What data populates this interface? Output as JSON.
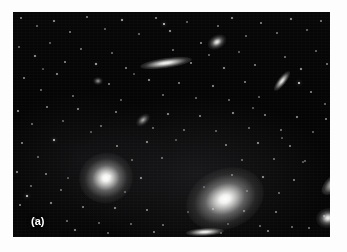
{
  "figure": {
    "panel_label": "(a)",
    "caption_alt": "",
    "background_color": "#ffffff",
    "plate_color": "#050505",
    "plate": {
      "x": 13,
      "y": 12,
      "width": 317,
      "height": 225
    }
  },
  "chart_data": {
    "type": "scatter",
    "title": "",
    "subtitle": "",
    "xlabel": "",
    "ylabel": "",
    "grid": false,
    "legend_position": "none",
    "annotations": [
      "(a)"
    ],
    "xlim": [
      0,
      317
    ],
    "ylim": [
      0,
      225
    ],
    "galaxies": [
      {
        "name": "large-elliptical-left",
        "x": 66,
        "y": 141,
        "rx": 27,
        "ry": 25,
        "rot": -15,
        "class": "gx-ell",
        "brightness": 1.0
      },
      {
        "name": "large-elliptical-center",
        "x": 172,
        "y": 157,
        "rx": 40,
        "ry": 30,
        "rot": -22,
        "class": "gx-ell",
        "brightness": 1.0
      },
      {
        "name": "edge-on-spiral-top",
        "x": 127,
        "y": 46,
        "rx": 26,
        "ry": 5,
        "rot": -8,
        "class": "gx-edge",
        "brightness": 0.95
      },
      {
        "name": "edge-on-lenticular-bottom",
        "x": 173,
        "y": 216,
        "rx": 19,
        "ry": 4,
        "rot": -3,
        "class": "gx-edge",
        "brightness": 0.95
      },
      {
        "name": "small-elliptical-top-right",
        "x": 194,
        "y": 23,
        "rx": 10,
        "ry": 7,
        "rot": -30,
        "class": "gx-ell",
        "brightness": 0.9
      },
      {
        "name": "inclined-spiral-right",
        "x": 257,
        "y": 65,
        "rx": 12,
        "ry": 4,
        "rot": -52,
        "class": "gx-edge",
        "brightness": 0.88
      },
      {
        "name": "small-spiral-mid-left",
        "x": 122,
        "y": 103,
        "rx": 8,
        "ry": 5,
        "rot": -40,
        "class": "gx-faint",
        "brightness": 0.8
      },
      {
        "name": "elongated-galaxy-right-edge",
        "x": 306,
        "y": 163,
        "rx": 16,
        "ry": 8,
        "rot": -40,
        "class": "gx-edge",
        "brightness": 0.92
      },
      {
        "name": "round-galaxy-right-edge",
        "x": 303,
        "y": 196,
        "rx": 12,
        "ry": 10,
        "rot": -10,
        "class": "gx-ell",
        "brightness": 0.92
      },
      {
        "name": "faint-fuzzy-upper-left",
        "x": 80,
        "y": 65,
        "rx": 5,
        "ry": 4,
        "rot": 0,
        "class": "gx-faint",
        "brightness": 0.7
      }
    ],
    "stars": [
      {
        "x": 8,
        "y": 6,
        "r": 0.8,
        "b": 0.5
      },
      {
        "x": 24,
        "y": 14,
        "r": 0.7,
        "b": 0.4
      },
      {
        "x": 41,
        "y": 9,
        "r": 0.9,
        "b": 0.6
      },
      {
        "x": 57,
        "y": 20,
        "r": 0.7,
        "b": 0.45
      },
      {
        "x": 74,
        "y": 5,
        "r": 0.8,
        "b": 0.5
      },
      {
        "x": 92,
        "y": 17,
        "r": 0.7,
        "b": 0.38
      },
      {
        "x": 109,
        "y": 8,
        "r": 1.0,
        "b": 0.7
      },
      {
        "x": 126,
        "y": 22,
        "r": 0.7,
        "b": 0.42
      },
      {
        "x": 143,
        "y": 6,
        "r": 0.8,
        "b": 0.52
      },
      {
        "x": 157,
        "y": 19,
        "r": 0.9,
        "b": 0.62
      },
      {
        "x": 151,
        "y": 12,
        "r": 1.3,
        "b": 0.85
      },
      {
        "x": 174,
        "y": 10,
        "r": 0.7,
        "b": 0.4
      },
      {
        "x": 188,
        "y": 31,
        "r": 0.8,
        "b": 0.55
      },
      {
        "x": 205,
        "y": 14,
        "r": 0.7,
        "b": 0.44
      },
      {
        "x": 219,
        "y": 6,
        "r": 0.9,
        "b": 0.58
      },
      {
        "x": 233,
        "y": 24,
        "r": 0.7,
        "b": 0.4
      },
      {
        "x": 248,
        "y": 11,
        "r": 0.8,
        "b": 0.5
      },
      {
        "x": 264,
        "y": 21,
        "r": 0.7,
        "b": 0.43
      },
      {
        "x": 278,
        "y": 7,
        "r": 0.9,
        "b": 0.6
      },
      {
        "x": 294,
        "y": 18,
        "r": 0.7,
        "b": 0.4
      },
      {
        "x": 308,
        "y": 9,
        "r": 0.8,
        "b": 0.48
      },
      {
        "x": 6,
        "y": 35,
        "r": 0.7,
        "b": 0.42
      },
      {
        "x": 22,
        "y": 44,
        "r": 0.9,
        "b": 0.62
      },
      {
        "x": 37,
        "y": 31,
        "r": 0.7,
        "b": 0.38
      },
      {
        "x": 52,
        "y": 50,
        "r": 0.8,
        "b": 0.52
      },
      {
        "x": 68,
        "y": 37,
        "r": 0.7,
        "b": 0.44
      },
      {
        "x": 83,
        "y": 52,
        "r": 1.0,
        "b": 0.72
      },
      {
        "x": 99,
        "y": 41,
        "r": 0.7,
        "b": 0.4
      },
      {
        "x": 113,
        "y": 56,
        "r": 0.8,
        "b": 0.5
      },
      {
        "x": 160,
        "y": 38,
        "r": 0.7,
        "b": 0.42
      },
      {
        "x": 178,
        "y": 51,
        "r": 0.8,
        "b": 0.54
      },
      {
        "x": 196,
        "y": 43,
        "r": 0.7,
        "b": 0.4
      },
      {
        "x": 211,
        "y": 56,
        "r": 0.9,
        "b": 0.6
      },
      {
        "x": 226,
        "y": 40,
        "r": 0.7,
        "b": 0.38
      },
      {
        "x": 242,
        "y": 53,
        "r": 0.8,
        "b": 0.5
      },
      {
        "x": 272,
        "y": 45,
        "r": 0.7,
        "b": 0.43
      },
      {
        "x": 288,
        "y": 57,
        "r": 0.9,
        "b": 0.62
      },
      {
        "x": 303,
        "y": 39,
        "r": 0.7,
        "b": 0.4
      },
      {
        "x": 314,
        "y": 52,
        "r": 0.8,
        "b": 0.48
      },
      {
        "x": 286,
        "y": 71,
        "r": 1.4,
        "b": 0.9
      },
      {
        "x": 11,
        "y": 66,
        "r": 0.8,
        "b": 0.52
      },
      {
        "x": 28,
        "y": 78,
        "r": 0.7,
        "b": 0.4
      },
      {
        "x": 44,
        "y": 62,
        "r": 0.9,
        "b": 0.58
      },
      {
        "x": 60,
        "y": 84,
        "r": 0.7,
        "b": 0.42
      },
      {
        "x": 96,
        "y": 72,
        "r": 0.8,
        "b": 0.5
      },
      {
        "x": 108,
        "y": 88,
        "r": 0.7,
        "b": 0.38
      },
      {
        "x": 136,
        "y": 68,
        "r": 0.9,
        "b": 0.6
      },
      {
        "x": 150,
        "y": 83,
        "r": 0.7,
        "b": 0.42
      },
      {
        "x": 166,
        "y": 71,
        "r": 0.8,
        "b": 0.5
      },
      {
        "x": 183,
        "y": 86,
        "r": 0.7,
        "b": 0.4
      },
      {
        "x": 200,
        "y": 74,
        "r": 0.9,
        "b": 0.58
      },
      {
        "x": 216,
        "y": 88,
        "r": 0.7,
        "b": 0.41
      },
      {
        "x": 232,
        "y": 70,
        "r": 0.8,
        "b": 0.5
      },
      {
        "x": 246,
        "y": 85,
        "r": 0.7,
        "b": 0.38
      },
      {
        "x": 298,
        "y": 80,
        "r": 0.8,
        "b": 0.52
      },
      {
        "x": 312,
        "y": 92,
        "r": 0.7,
        "b": 0.4
      },
      {
        "x": 5,
        "y": 99,
        "r": 0.9,
        "b": 0.6
      },
      {
        "x": 19,
        "y": 112,
        "r": 0.7,
        "b": 0.42
      },
      {
        "x": 34,
        "y": 95,
        "r": 0.8,
        "b": 0.5
      },
      {
        "x": 50,
        "y": 109,
        "r": 0.7,
        "b": 0.38
      },
      {
        "x": 65,
        "y": 97,
        "r": 0.9,
        "b": 0.56
      },
      {
        "x": 88,
        "y": 114,
        "r": 0.7,
        "b": 0.41
      },
      {
        "x": 103,
        "y": 100,
        "r": 0.8,
        "b": 0.5
      },
      {
        "x": 140,
        "y": 116,
        "r": 0.7,
        "b": 0.4
      },
      {
        "x": 155,
        "y": 102,
        "r": 0.9,
        "b": 0.58
      },
      {
        "x": 171,
        "y": 118,
        "r": 0.7,
        "b": 0.42
      },
      {
        "x": 187,
        "y": 104,
        "r": 0.8,
        "b": 0.52
      },
      {
        "x": 203,
        "y": 119,
        "r": 0.7,
        "b": 0.38
      },
      {
        "x": 220,
        "y": 101,
        "r": 0.9,
        "b": 0.6
      },
      {
        "x": 236,
        "y": 116,
        "r": 0.7,
        "b": 0.4
      },
      {
        "x": 252,
        "y": 103,
        "r": 0.8,
        "b": 0.5
      },
      {
        "x": 268,
        "y": 118,
        "r": 0.7,
        "b": 0.43
      },
      {
        "x": 284,
        "y": 105,
        "r": 0.9,
        "b": 0.57
      },
      {
        "x": 300,
        "y": 120,
        "r": 0.7,
        "b": 0.39
      },
      {
        "x": 313,
        "y": 107,
        "r": 0.8,
        "b": 0.5
      },
      {
        "x": 9,
        "y": 131,
        "r": 0.8,
        "b": 0.52
      },
      {
        "x": 25,
        "y": 145,
        "r": 0.7,
        "b": 0.4
      },
      {
        "x": 41,
        "y": 128,
        "r": 1.2,
        "b": 0.82
      },
      {
        "x": 104,
        "y": 134,
        "r": 0.8,
        "b": 0.5
      },
      {
        "x": 119,
        "y": 148,
        "r": 0.7,
        "b": 0.38
      },
      {
        "x": 134,
        "y": 130,
        "r": 0.9,
        "b": 0.58
      },
      {
        "x": 149,
        "y": 146,
        "r": 0.7,
        "b": 0.41
      },
      {
        "x": 213,
        "y": 133,
        "r": 0.8,
        "b": 0.5
      },
      {
        "x": 229,
        "y": 148,
        "r": 0.7,
        "b": 0.4
      },
      {
        "x": 245,
        "y": 131,
        "r": 0.9,
        "b": 0.6
      },
      {
        "x": 261,
        "y": 147,
        "r": 0.7,
        "b": 0.42
      },
      {
        "x": 277,
        "y": 134,
        "r": 0.8,
        "b": 0.5
      },
      {
        "x": 292,
        "y": 149,
        "r": 0.7,
        "b": 0.38
      },
      {
        "x": 4,
        "y": 160,
        "r": 0.9,
        "b": 0.56
      },
      {
        "x": 18,
        "y": 174,
        "r": 0.7,
        "b": 0.4
      },
      {
        "x": 33,
        "y": 162,
        "r": 0.8,
        "b": 0.5
      },
      {
        "x": 48,
        "y": 178,
        "r": 0.7,
        "b": 0.42
      },
      {
        "x": 97,
        "y": 164,
        "r": 0.8,
        "b": 0.52
      },
      {
        "x": 112,
        "y": 180,
        "r": 0.7,
        "b": 0.38
      },
      {
        "x": 128,
        "y": 166,
        "r": 0.9,
        "b": 0.58
      },
      {
        "x": 219,
        "y": 163,
        "r": 0.8,
        "b": 0.5
      },
      {
        "x": 234,
        "y": 179,
        "r": 0.7,
        "b": 0.4
      },
      {
        "x": 250,
        "y": 165,
        "r": 0.9,
        "b": 0.6
      },
      {
        "x": 266,
        "y": 181,
        "r": 0.7,
        "b": 0.41
      },
      {
        "x": 281,
        "y": 168,
        "r": 0.8,
        "b": 0.5
      },
      {
        "x": 7,
        "y": 193,
        "r": 0.8,
        "b": 0.52
      },
      {
        "x": 22,
        "y": 207,
        "r": 0.7,
        "b": 0.4
      },
      {
        "x": 38,
        "y": 191,
        "r": 0.9,
        "b": 0.58
      },
      {
        "x": 54,
        "y": 209,
        "r": 0.7,
        "b": 0.42
      },
      {
        "x": 70,
        "y": 195,
        "r": 0.8,
        "b": 0.5
      },
      {
        "x": 86,
        "y": 211,
        "r": 0.7,
        "b": 0.38
      },
      {
        "x": 14,
        "y": 184,
        "r": 1.3,
        "b": 0.88
      },
      {
        "x": 102,
        "y": 196,
        "r": 0.9,
        "b": 0.57
      },
      {
        "x": 118,
        "y": 212,
        "r": 0.7,
        "b": 0.4
      },
      {
        "x": 134,
        "y": 198,
        "r": 0.8,
        "b": 0.5
      },
      {
        "x": 150,
        "y": 213,
        "r": 0.7,
        "b": 0.41
      },
      {
        "x": 200,
        "y": 197,
        "r": 0.8,
        "b": 0.52
      },
      {
        "x": 215,
        "y": 212,
        "r": 0.7,
        "b": 0.38
      },
      {
        "x": 231,
        "y": 199,
        "r": 0.9,
        "b": 0.58
      },
      {
        "x": 247,
        "y": 214,
        "r": 0.7,
        "b": 0.4
      },
      {
        "x": 263,
        "y": 200,
        "r": 0.8,
        "b": 0.5
      },
      {
        "x": 279,
        "y": 215,
        "r": 0.7,
        "b": 0.42
      },
      {
        "x": 62,
        "y": 218,
        "r": 0.9,
        "b": 0.56
      },
      {
        "x": 95,
        "y": 221,
        "r": 0.7,
        "b": 0.4
      },
      {
        "x": 141,
        "y": 220,
        "r": 0.8,
        "b": 0.5
      },
      {
        "x": 208,
        "y": 221,
        "r": 0.7,
        "b": 0.38
      },
      {
        "x": 255,
        "y": 219,
        "r": 0.9,
        "b": 0.55
      },
      {
        "x": 296,
        "y": 216,
        "r": 0.7,
        "b": 0.41
      },
      {
        "x": 311,
        "y": 204,
        "r": 0.8,
        "b": 0.48
      },
      {
        "x": 30,
        "y": 57,
        "r": 0.6,
        "b": 0.3
      },
      {
        "x": 78,
        "y": 120,
        "r": 0.6,
        "b": 0.32
      },
      {
        "x": 163,
        "y": 128,
        "r": 0.6,
        "b": 0.3
      },
      {
        "x": 191,
        "y": 175,
        "r": 0.6,
        "b": 0.34
      },
      {
        "x": 121,
        "y": 62,
        "r": 0.6,
        "b": 0.3
      },
      {
        "x": 240,
        "y": 96,
        "r": 0.6,
        "b": 0.33
      },
      {
        "x": 269,
        "y": 126,
        "r": 0.6,
        "b": 0.3
      },
      {
        "x": 55,
        "y": 166,
        "r": 0.6,
        "b": 0.31
      },
      {
        "x": 175,
        "y": 200,
        "r": 0.6,
        "b": 0.3
      },
      {
        "x": 290,
        "y": 150,
        "r": 0.6,
        "b": 0.32
      }
    ]
  }
}
